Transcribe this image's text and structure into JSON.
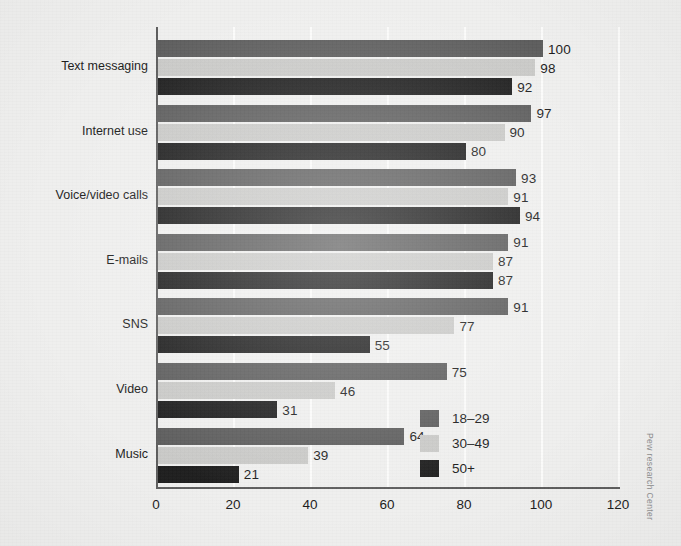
{
  "chart_data": {
    "type": "bar",
    "orientation": "horizontal",
    "title": "",
    "xlabel": "",
    "ylabel": "",
    "xlim": [
      0,
      120
    ],
    "xticks": [
      "0",
      "20",
      "40",
      "60",
      "80",
      "100",
      "120"
    ],
    "grid": "vertical-light",
    "legend_position": "inside-lower-right",
    "categories": [
      "Text messaging",
      "Internet use",
      "Voice/video calls",
      "E-mails",
      "SNS",
      "Video",
      "Music"
    ],
    "series": [
      {
        "name": "18–29",
        "color": "#5c5c5c",
        "values": [
          100,
          97,
          93,
          91,
          91,
          75,
          64
        ]
      },
      {
        "name": "30–49",
        "color": "#c9c9c7",
        "values": [
          98,
          90,
          91,
          87,
          77,
          46,
          39
        ]
      },
      {
        "name": "50+",
        "color": "#1d1d1d",
        "values": [
          92,
          80,
          94,
          87,
          55,
          31,
          21
        ]
      }
    ]
  },
  "legend": {
    "items": [
      {
        "label": "18–29",
        "swatch": "#5c5c5c"
      },
      {
        "label": "30–49",
        "swatch": "#c9c9c7"
      },
      {
        "label": "50+",
        "swatch": "#1d1d1d"
      }
    ]
  },
  "credit": {
    "text": "Pew research Center"
  },
  "colors": {
    "background": "#efefee",
    "axis": "#5d5d5d",
    "text": "#1b1b1b",
    "gridline": "#ffffff"
  }
}
